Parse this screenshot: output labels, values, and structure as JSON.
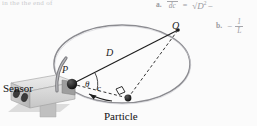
{
  "figure": {
    "top_cut_text": "in the the end of",
    "labels": {
      "sensor": "Sensor",
      "particle": "Particle",
      "point_p": "P",
      "point_q": "Q",
      "diameter": "D",
      "chord": "c",
      "angle": "θ"
    },
    "colors": {
      "ink": "#1c1c1c",
      "circle_stroke": "#6f6f74",
      "sensor_body": "#d8d8d8",
      "sensor_shadow": "#a8a8a8",
      "dashed": "#2b2b2b",
      "faint_text": "#9a9a9f",
      "background": "#fbfbfb"
    }
  },
  "answers": {
    "a": {
      "label": "a.",
      "lhs_numerator": "",
      "lhs_denominator": "dc",
      "equals": "=",
      "rhs_radicand": "D",
      "rhs_radicand_exponent": "2",
      "rhs_trailing": "−"
    },
    "b": {
      "label": "b.",
      "sign": "−",
      "numerator": "1",
      "denominator": "L"
    }
  }
}
